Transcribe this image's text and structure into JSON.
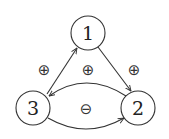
{
  "diagram": {
    "nodes": [
      {
        "id": "1",
        "label": "1"
      },
      {
        "id": "2",
        "label": "2"
      },
      {
        "id": "3",
        "label": "3"
      }
    ],
    "edges": [
      {
        "from": "3",
        "to": "1",
        "shape": "straight"
      },
      {
        "from": "1",
        "to": "2",
        "shape": "straight"
      },
      {
        "from": "2",
        "to": "3",
        "shape": "curve-upper"
      },
      {
        "from": "3",
        "to": "2",
        "shape": "curve-lower"
      }
    ],
    "labels": [
      {
        "name": "edge-label-left",
        "text": "⊕"
      },
      {
        "name": "edge-label-center",
        "text": "⊕"
      },
      {
        "name": "edge-label-right",
        "text": "⊕"
      },
      {
        "name": "edge-label-bottom",
        "text": "⊖"
      }
    ]
  }
}
